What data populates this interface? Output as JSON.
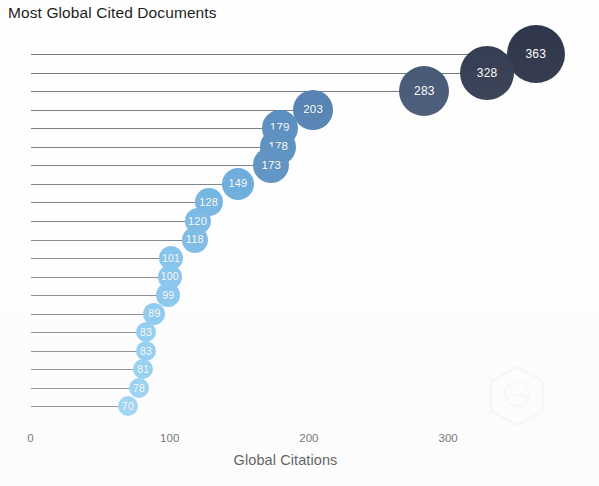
{
  "chart_data": {
    "type": "bar",
    "title": "Most Global Cited Documents",
    "xlabel": "Global Citations",
    "ylabel": "",
    "orientation": "horizontal",
    "style": "lollipop",
    "grid": false,
    "legend": false,
    "xlim": [
      0,
      380
    ],
    "xticks": [
      0,
      100,
      200,
      300
    ],
    "xtick_labels": [
      "0",
      "100",
      "200",
      "300"
    ],
    "categories": [
      "doc-1",
      "doc-2",
      "doc-3",
      "doc-4",
      "doc-5",
      "doc-6",
      "doc-7",
      "doc-8",
      "doc-9",
      "doc-10",
      "doc-11",
      "doc-12",
      "doc-13",
      "doc-14",
      "doc-15",
      "doc-16",
      "doc-17",
      "doc-18",
      "doc-19",
      "doc-20"
    ],
    "values": [
      363,
      328,
      283,
      203,
      179,
      178,
      173,
      149,
      128,
      120,
      118,
      101,
      100,
      99,
      89,
      83,
      83,
      81,
      78,
      70
    ],
    "point_labels": [
      "363",
      "328",
      "283",
      "203",
      "179",
      "178",
      "173",
      "149",
      "128",
      "120",
      "118",
      "101",
      "100",
      "99",
      "89",
      "83",
      "83",
      "81",
      "78",
      "70"
    ],
    "colors": [
      "#2b3247",
      "#2f374d",
      "#3f5270",
      "#4a7bae",
      "#4e86bb",
      "#4e86bb",
      "#4f88bd",
      "#5ba3d8",
      "#62acdf",
      "#66b0e2",
      "#67b1e3",
      "#6fbaea",
      "#70bbeb",
      "#71bcec",
      "#74c0ee",
      "#77c3ef",
      "#77c3ef",
      "#78c4ef",
      "#7ac6f0",
      "#7ec8f0"
    ],
    "radii": [
      29,
      27,
      25,
      20,
      18,
      18,
      18,
      16,
      14,
      13,
      13,
      12,
      12,
      12,
      11,
      10,
      10,
      10,
      10,
      10
    ],
    "colorbar_note": "bubble color encodes citation count: dark navy = highest, light sky blue = lowest",
    "size_note": "bubble radius scales with citation count"
  },
  "axis": {
    "x_label": "Global Citations",
    "ticks": [
      "0",
      "100",
      "200",
      "300"
    ]
  },
  "watermark": {
    "name": "hexagon-watermark",
    "visible": true
  }
}
